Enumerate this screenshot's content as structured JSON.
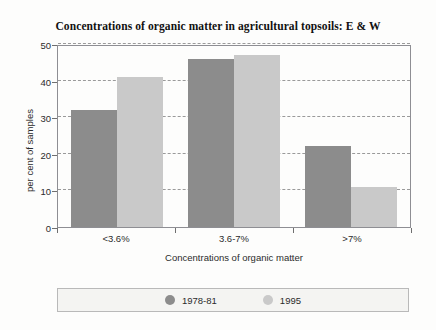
{
  "chart_data": {
    "type": "bar",
    "title": "Concentrations of organic matter in agricultural topsoils: E & W",
    "xlabel": "Concentrations of organic matter",
    "ylabel": "per cent of samples",
    "categories": [
      "<3.6%",
      "3.6-7%",
      ">7%"
    ],
    "series": [
      {
        "name": "1978-81",
        "color": "#8c8c8c",
        "values": [
          32,
          46,
          22
        ]
      },
      {
        "name": "1995",
        "color": "#c9c9c9",
        "values": [
          41,
          47,
          11
        ]
      }
    ],
    "ylim": [
      0,
      50
    ],
    "yticks": [
      0,
      10,
      20,
      30,
      40,
      50
    ],
    "ytick_labels": [
      "0",
      "10",
      "20",
      "30",
      "40",
      "50"
    ],
    "grid": "horizontal-dashed",
    "legend_position": "bottom",
    "legend_marker": "circle"
  },
  "icons": {
    "legend_marker_a": "circle-swatch-icon",
    "legend_marker_b": "circle-swatch-icon"
  }
}
